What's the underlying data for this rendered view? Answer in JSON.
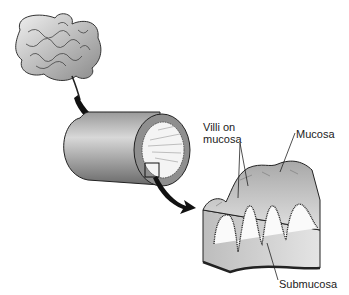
{
  "diagram": {
    "labels": {
      "villi": "Villi on mucosa",
      "villi_line1": "Villi on",
      "villi_line2": "mucosa",
      "mucosa": "Mucosa",
      "submucosa": "Submucosa"
    },
    "parts": [
      "small-intestine",
      "intestine-tube-cross-section",
      "magnified-wall-section"
    ],
    "colors": {
      "tissue_gray": "#9a9a9a",
      "light": "#f2f2f2",
      "outline": "#222222"
    }
  }
}
